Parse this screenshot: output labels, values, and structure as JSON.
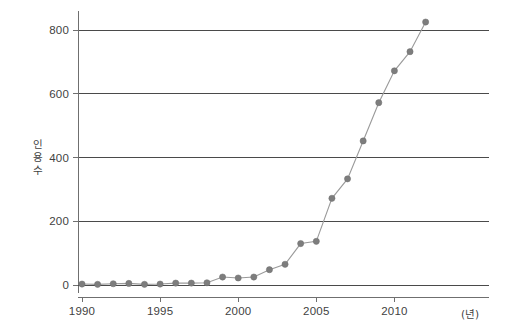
{
  "chart_data": {
    "type": "line",
    "title": "",
    "subtitle": "",
    "xlabel": "(년)",
    "ylabel": "인용 수",
    "ylabel_chars": [
      "인",
      "용",
      "수"
    ],
    "x": [
      1990,
      1991,
      1992,
      1993,
      1994,
      1995,
      1996,
      1997,
      1998,
      1999,
      2000,
      2001,
      2002,
      2003,
      2004,
      2005,
      2006,
      2007,
      2008,
      2009,
      2010,
      2011,
      2012
    ],
    "values": [
      3,
      2,
      4,
      5,
      2,
      3,
      6,
      6,
      7,
      25,
      22,
      25,
      48,
      65,
      130,
      137,
      272,
      333,
      452,
      572,
      672,
      732,
      825
    ],
    "series": [
      {
        "name": "인용 수",
        "values": [
          3,
          2,
          4,
          5,
          2,
          3,
          6,
          6,
          7,
          25,
          22,
          25,
          48,
          65,
          130,
          137,
          272,
          333,
          452,
          572,
          672,
          732,
          825
        ]
      }
    ],
    "xlim": [
      1989.4,
      2012.8
    ],
    "ylim": [
      0,
      860
    ],
    "xticks": [
      1990,
      1995,
      2000,
      2005,
      2010
    ],
    "xtick_labels": [
      "1990",
      "1995",
      "2000",
      "2005",
      "2010"
    ],
    "yticks": [
      0,
      200,
      400,
      600,
      800
    ],
    "ytick_labels": [
      "0",
      "200",
      "400",
      "600",
      "800"
    ],
    "gridlines_y": [
      200,
      400,
      600,
      800
    ],
    "grid": "horizontal",
    "legend": "none",
    "marker": "circle",
    "colors": {
      "line": "#9a9a9a",
      "marker": "#7d7d7d",
      "grid": "#4a4a4a",
      "axis": "#6f6f6f",
      "text": "#3f3f3f",
      "background": "#ffffff"
    }
  }
}
